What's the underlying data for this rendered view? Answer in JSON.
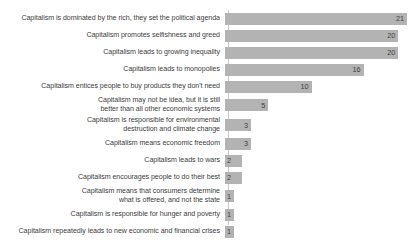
{
  "chart_data": {
    "type": "bar",
    "orientation": "horizontal",
    "title": "",
    "xlabel": "",
    "ylabel": "",
    "grid": false,
    "legend": false,
    "xlim": [
      0,
      21
    ],
    "max_value": 21,
    "categories": [
      "Capitalism is dominated by the rich, they set the political agenda",
      "Capitalism promotes selfishness and greed",
      "Capitalism leads to growing inequality",
      "Capitalism leads to monopolies",
      "Capitalism entices people to buy products they don't need",
      "Capitalism may not be idea, but it is still\nbetter than all other economic systems",
      "Capitalism is responsible for environmental\ndestruction and climate change",
      "Capitalism means economic freedom",
      "Capitalism leads to wars",
      "Capitalism encourages people to do their best",
      "Capitalism means that consumers determine\nwhat is offered, and not the state",
      "Capitalism is responsible for hunger and poverty",
      "Capitalism repeatedly leads to new economic and financial crises"
    ],
    "values": [
      21,
      20,
      20,
      16,
      10,
      5,
      3,
      3,
      2,
      2,
      1,
      1,
      1
    ],
    "value_labels": [
      "21",
      "20",
      "20",
      "16",
      "10",
      "5",
      "3",
      "3",
      "2",
      "2",
      "1",
      "1",
      "1"
    ],
    "colors": {
      "bar": "#b3b3b3",
      "text": "#404040",
      "axis": "#c9c9c9",
      "background": "#ffffff"
    }
  }
}
